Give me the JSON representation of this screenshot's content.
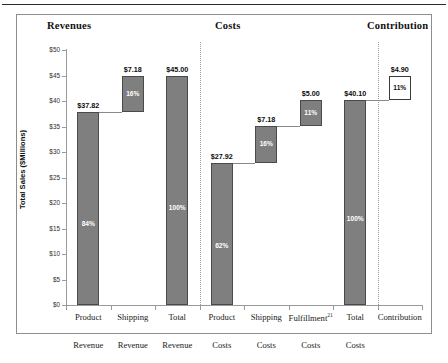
{
  "figure": {
    "sections": [
      {
        "key": "revenues",
        "label": "Revenues"
      },
      {
        "key": "costs",
        "label": "Costs"
      },
      {
        "key": "contribution",
        "label": "Contribution"
      }
    ],
    "caption_fragment": ""
  },
  "chart_data": {
    "type": "bar",
    "subtype": "waterfall",
    "title": "",
    "xlabel": "",
    "ylabel": "Total Sales ($Millions)",
    "ylim": [
      0,
      50
    ],
    "ytick_values": [
      0,
      5,
      10,
      15,
      20,
      25,
      30,
      35,
      40,
      45,
      50
    ],
    "ytick_labels": [
      "$0",
      "$5",
      "$10",
      "$15",
      "$20",
      "$25",
      "$30",
      "$35",
      "$40",
      "$45",
      "$50"
    ],
    "grid": false,
    "legend": "none",
    "categories": [
      "Product Revenue",
      "Shipping Revenue",
      "Total Revenue",
      "Product Costs",
      "Shipping Costs",
      "Fulfillment Costs",
      "Total Costs",
      "Contribution"
    ],
    "bars": [
      {
        "name": "product-revenue",
        "line1": "Product",
        "sup": "",
        "line2": "Revenue",
        "base": 0,
        "top": 37.82,
        "value": 37.82,
        "value_label": "$37.82",
        "pct_label": "84%",
        "style": "filled",
        "section": "revenues"
      },
      {
        "name": "shipping-revenue",
        "line1": "Shipping",
        "sup": "",
        "line2": "Revenue",
        "base": 37.82,
        "top": 45.0,
        "value": 7.18,
        "value_label": "$7.18",
        "pct_label": "16%",
        "style": "filled",
        "section": "revenues"
      },
      {
        "name": "total-revenue",
        "line1": "Total",
        "sup": "",
        "line2": "Revenue",
        "base": 0,
        "top": 45.0,
        "value": 45.0,
        "value_label": "$45.00",
        "pct_label": "100%",
        "style": "filled",
        "section": "revenues"
      },
      {
        "name": "product-costs",
        "line1": "Product",
        "sup": "",
        "line2": "Costs",
        "base": 0,
        "top": 27.92,
        "value": 27.92,
        "value_label": "$27.92",
        "pct_label": "62%",
        "style": "filled",
        "section": "costs"
      },
      {
        "name": "shipping-costs",
        "line1": "Shipping",
        "sup": "",
        "line2": "Costs",
        "base": 27.92,
        "top": 35.1,
        "value": 7.18,
        "value_label": "$7.18",
        "pct_label": "16%",
        "style": "filled",
        "section": "costs"
      },
      {
        "name": "fulfillment-costs",
        "line1": "Fulfillment",
        "sup": "21",
        "line2": "Costs",
        "base": 35.1,
        "top": 40.1,
        "value": 5.0,
        "value_label": "$5.00",
        "pct_label": "11%",
        "style": "filled",
        "section": "costs"
      },
      {
        "name": "total-costs",
        "line1": "Total",
        "sup": "",
        "line2": "Costs",
        "base": 0,
        "top": 40.1,
        "value": 40.1,
        "value_label": "$40.10",
        "pct_label": "100%",
        "style": "filled",
        "section": "costs"
      },
      {
        "name": "contribution",
        "line1": "Contribution",
        "sup": "",
        "line2": "",
        "base": 40.1,
        "top": 45.0,
        "value": 4.9,
        "value_label": "$4.90",
        "pct_label": "11%",
        "style": "open",
        "section": "contribution"
      }
    ],
    "colors": {
      "bar_fill": "#7f7f7f",
      "bar_border": "#4a4a4a",
      "open_fill": "#ffffff",
      "open_border": "#3a3a3a",
      "axis": "#9a9a9a",
      "text": "#111111"
    }
  }
}
